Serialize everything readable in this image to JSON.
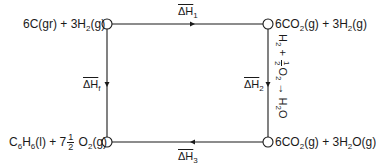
{
  "diagram": {
    "type": "thermochemical-cycle",
    "line_color": "#1a1a1a",
    "nodes": {
      "top_left": {
        "coef1": "6C(gr) + 3H",
        "sub1": "2",
        "tail1": "(g)"
      },
      "top_right": {
        "coef1": "6CO",
        "sub1": "2",
        "mid": "(g) + 3H",
        "sub2": "2",
        "tail": "(g)"
      },
      "bottom_left": {
        "c": "C",
        "sub_c": "6",
        "h": "H",
        "sub_h": "6",
        "mid": "(l) + 7",
        "frac_num": "1",
        "frac_den": "2",
        "o": " O",
        "sub_o": "2",
        "tail": "(g)"
      },
      "bottom_right": {
        "coef1": "6CO",
        "sub1": "2",
        "mid": "(g) + 3H",
        "sub2": "2",
        "tail": "O(g)"
      }
    },
    "edges": {
      "dh1": {
        "label": "ΔH",
        "sub": "1",
        "direction": "top_left -> top_right"
      },
      "dhf": {
        "label": "ΔH",
        "sub": "f",
        "direction": "top_left -> bottom_left"
      },
      "dh2": {
        "label": "ΔH",
        "sub": "2",
        "direction": "top_right -> bottom_right"
      },
      "dh3": {
        "label": "ΔH",
        "sub": "3",
        "direction": "bottom_right -> bottom_left"
      }
    },
    "side_reaction": {
      "h": "H",
      "sub_h": "2",
      "plus": " + ",
      "frac_num": "1",
      "frac_den": "2",
      "o": "O",
      "sub_o": "2",
      "arrow": " → ",
      "product": "H",
      "sub_p": "2",
      "product_tail": "O"
    }
  }
}
